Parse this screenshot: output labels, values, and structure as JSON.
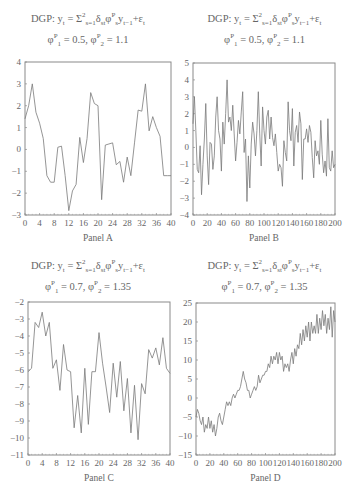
{
  "figure": {
    "panels": [
      {
        "id": "A",
        "label": "Panel A",
        "title_line1": "DGP: y",
        "title_eq": "t = Σ²s=1δstφᴾsyt−1+εt",
        "title_line2": "φᴾ1 = 0.5, φᴾ2 = 1.1"
      },
      {
        "id": "B",
        "label": "Panel B",
        "title_line1": "DGP: y",
        "title_eq": "t = Σ²s=1δstφᴾsyt−1+εt",
        "title_line2": "φᴾ1 = 0.5, φᴾ2 = 1.1"
      },
      {
        "id": "C",
        "label": "Panel C",
        "title_line1": "DGP: y",
        "title_eq": "t = Σ²s=1δstφᴾsyt−1+εt",
        "title_line2": "φᴾ1 = 0.7, φᴾ2 = 1.35"
      },
      {
        "id": "D",
        "label": "Panel D",
        "title_line1": "DGP: y",
        "title_eq": "t = Σ²s=1δstφᴾsyt−1+εt",
        "title_line2": "φᴾ1 = 0.7, φᴾ2 = 1.35"
      }
    ]
  },
  "chart_data": [
    {
      "type": "line",
      "title": "DGP: y_t = Σ_{s=1}^{2} δ_st φ^P_s y_{t-1} + ε_t ; φ^P_1 = 0.5, φ^P_2 = 1.1",
      "xlabel": "Panel A",
      "ylabel": "",
      "xlim": [
        0,
        40
      ],
      "ylim": [
        -3,
        4
      ],
      "xticks": [
        0,
        4,
        8,
        12,
        16,
        20,
        24,
        28,
        32,
        36,
        40
      ],
      "yticks": [
        -3,
        -2,
        -1,
        0,
        1,
        2,
        3,
        4
      ],
      "grid": false,
      "x": [
        0,
        1,
        2,
        3,
        4,
        5,
        6,
        7,
        8,
        9,
        10,
        11,
        12,
        13,
        14,
        15,
        16,
        17,
        18,
        19,
        20,
        21,
        22,
        23,
        24,
        25,
        26,
        27,
        28,
        29,
        30,
        31,
        32,
        33,
        34,
        35,
        36,
        37,
        38,
        39,
        40
      ],
      "values": [
        1.4,
        2.0,
        3.0,
        1.7,
        1.2,
        0.5,
        -1.2,
        -1.5,
        -1.5,
        0.1,
        0.15,
        -1.2,
        -2.8,
        -1.9,
        -1.6,
        0.55,
        -0.6,
        0.5,
        2.6,
        2.1,
        2.0,
        -2.3,
        0.2,
        0.25,
        0.3,
        -0.7,
        -0.55,
        -1.5,
        -0.35,
        -1.2,
        0.3,
        1.8,
        1.75,
        3.0,
        0.85,
        1.5,
        1.0,
        0.6,
        -1.2,
        -1.2,
        -1.2
      ]
    },
    {
      "type": "line",
      "title": "DGP: y_t = Σ_{s=1}^{2} δ_st φ^P_s y_{t-1} + ε_t ; φ^P_1 = 0.5, φ^P_2 = 1.1",
      "xlabel": "Panel B",
      "ylabel": "",
      "xlim": [
        0,
        200
      ],
      "ylim": [
        -4,
        5
      ],
      "xticks": [
        0,
        20,
        40,
        60,
        80,
        100,
        120,
        140,
        160,
        180,
        200
      ],
      "yticks": [
        -4,
        -3,
        -2,
        -1,
        0,
        1,
        2,
        3,
        4,
        5
      ],
      "grid": false,
      "x_step": 2,
      "values": [
        1.4,
        3.0,
        1.0,
        -1.3,
        -1.5,
        0.1,
        -2.8,
        -1.0,
        0.5,
        2.6,
        -0.5,
        -2.2,
        0.3,
        0.2,
        -1.3,
        -0.5,
        1.8,
        3.0,
        1.0,
        0.5,
        -1.4,
        1.5,
        0.2,
        2.0,
        4.0,
        1.5,
        1.8,
        1.0,
        2.5,
        0.8,
        -0.8,
        0.3,
        1.6,
        0.8,
        2.1,
        3.3,
        -0.3,
        0.5,
        -3.2,
        -0.5,
        -2.4,
        0.2,
        1.5,
        0.8,
        -0.5,
        1.0,
        3.3,
        0.8,
        -1.1,
        2.4,
        1.0,
        0.2,
        1.8,
        2.2,
        0.5,
        1.8,
        0.6,
        0.1,
        0.8,
        -0.3,
        -1.4,
        -1.0,
        -1.2,
        -2.3,
        0.4,
        -0.3,
        -0.8,
        2.7,
        1.0,
        0.4,
        2.3,
        -1.1,
        0.9,
        1.3,
        0.3,
        2.1,
        1.4,
        -1.9,
        0.5,
        0.5,
        1.1,
        0.3,
        1.3,
        0.9,
        -0.6,
        -1.8,
        0.4,
        -0.5,
        -0.2,
        -1.0,
        1.6,
        -0.4,
        -1.5,
        -0.8,
        -1.7,
        1.7,
        -1.2,
        -1.4,
        -0.2,
        -1.2,
        -1.0
      ]
    },
    {
      "type": "line",
      "title": "DGP: y_t = Σ_{s=1}^{2} δ_st φ^P_s y_{t-1} + ε_t ; φ^P_1 = 0.7, φ^P_2 = 1.35",
      "xlabel": "Panel C",
      "ylabel": "",
      "xlim": [
        0,
        40
      ],
      "ylim": [
        -11,
        -2
      ],
      "xticks": [
        0,
        4,
        8,
        12,
        16,
        20,
        24,
        28,
        32,
        36,
        40
      ],
      "yticks": [
        -11,
        -10,
        -9,
        -8,
        -7,
        -6,
        -5,
        -4,
        -3,
        -2
      ],
      "grid": false,
      "x": [
        0,
        1,
        2,
        3,
        4,
        5,
        6,
        7,
        8,
        9,
        10,
        11,
        12,
        13,
        14,
        15,
        16,
        17,
        18,
        19,
        20,
        21,
        22,
        23,
        24,
        25,
        26,
        27,
        28,
        29,
        30,
        31,
        32,
        33,
        34,
        35,
        36,
        37,
        38,
        39,
        40
      ],
      "values": [
        -6.1,
        -5.9,
        -3.2,
        -3.5,
        -2.6,
        -4.0,
        -3.2,
        -5.9,
        -5.4,
        -7.2,
        -4.5,
        -6.0,
        -6.1,
        -9.4,
        -7.5,
        -9.7,
        -5.9,
        -9.2,
        -6.1,
        -6.1,
        -3.8,
        -5.6,
        -7.0,
        -8.5,
        -5.6,
        -7.6,
        -5.5,
        -8.4,
        -6.5,
        -9.7,
        -6.9,
        -10.1,
        -6.8,
        -7.4,
        -4.8,
        -5.3,
        -4.7,
        -5.7,
        -4.1,
        -5.9,
        -6.2
      ]
    },
    {
      "type": "line",
      "title": "DGP: y_t = Σ_{s=1}^{2} δ_st φ^P_s y_{t-1} + ε_t ; φ^P_1 = 0.7, φ^P_2 = 1.35",
      "xlabel": "Panel D",
      "ylabel": "",
      "xlim": [
        0,
        200
      ],
      "ylim": [
        -15,
        25
      ],
      "xticks": [
        0,
        20,
        40,
        60,
        80,
        100,
        120,
        140,
        160,
        180,
        200
      ],
      "yticks": [
        -15,
        -10,
        -5,
        0,
        5,
        10,
        15,
        20,
        25
      ],
      "grid": false,
      "x_step": 2,
      "values": [
        -5,
        -3,
        -4,
        -6,
        -7,
        -5,
        -9,
        -7,
        -8,
        -5,
        -8,
        -6,
        -9,
        -7,
        -10,
        -8,
        -5,
        -4,
        -6,
        -7,
        -5,
        -3,
        -1,
        -2,
        -1,
        -2,
        0,
        1,
        0,
        1,
        2,
        2,
        3,
        5,
        7,
        5,
        4,
        2,
        2,
        0,
        1,
        2,
        3,
        2,
        3,
        6,
        4,
        5,
        6,
        6,
        7,
        7,
        9,
        8,
        11,
        9,
        11,
        10,
        12,
        9,
        12,
        10,
        11,
        7,
        9,
        8,
        9,
        7,
        10,
        12,
        9,
        13,
        11,
        14,
        13,
        17,
        14,
        18,
        15,
        19,
        16,
        20,
        15,
        20,
        17,
        19,
        17,
        22,
        17,
        21,
        18,
        23,
        19,
        22,
        17,
        21,
        18,
        24,
        16,
        23,
        20
      ]
    }
  ]
}
